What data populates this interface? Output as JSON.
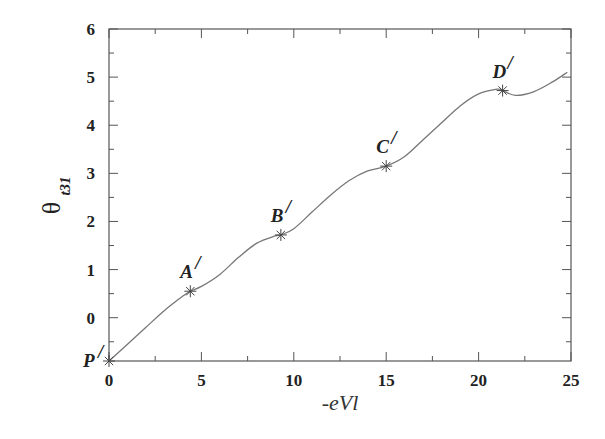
{
  "chart_data": {
    "type": "line",
    "title": "",
    "xlabel": "-eVl",
    "ylabel": "θ_t31",
    "ylabel_symbol": "θ",
    "ylabel_subscript": "t31",
    "xlim": [
      0,
      25
    ],
    "ylim": [
      -0.9,
      6
    ],
    "x_ticks": [
      0,
      5,
      10,
      15,
      20,
      25
    ],
    "x_tick_labels": [
      "0",
      "5",
      "10",
      "15",
      "20",
      "25"
    ],
    "y_ticks": [
      0,
      1,
      2,
      3,
      4,
      5,
      6
    ],
    "y_tick_labels": [
      "0",
      "1",
      "2",
      "3",
      "4",
      "5",
      "6"
    ],
    "grid": false,
    "legend": null,
    "series": [
      {
        "name": "theta_t31",
        "color": "#777777",
        "x": [
          0,
          1,
          2,
          3,
          4,
          4.4,
          5,
          6,
          7,
          8,
          9,
          9.3,
          10,
          11,
          12,
          13,
          14,
          15,
          16,
          17,
          18,
          19,
          20,
          21,
          21.3,
          22,
          23,
          24,
          24.8
        ],
        "y": [
          -0.9,
          -0.55,
          -0.2,
          0.15,
          0.45,
          0.55,
          0.65,
          0.9,
          1.25,
          1.55,
          1.7,
          1.72,
          1.85,
          2.2,
          2.55,
          2.85,
          3.05,
          3.15,
          3.35,
          3.7,
          4.05,
          4.4,
          4.65,
          4.75,
          4.72,
          4.62,
          4.7,
          4.9,
          5.1
        ]
      }
    ],
    "annotations": [
      {
        "label": "P",
        "x": 0,
        "y": -0.9,
        "marker": "asterisk"
      },
      {
        "label": "A",
        "x": 4.4,
        "y": 0.55,
        "marker": "asterisk"
      },
      {
        "label": "B",
        "x": 9.3,
        "y": 1.72,
        "marker": "asterisk"
      },
      {
        "label": "C",
        "x": 15.0,
        "y": 3.15,
        "marker": "asterisk"
      },
      {
        "label": "D",
        "x": 21.3,
        "y": 4.72,
        "marker": "asterisk"
      }
    ],
    "prime_symbol": "/"
  }
}
